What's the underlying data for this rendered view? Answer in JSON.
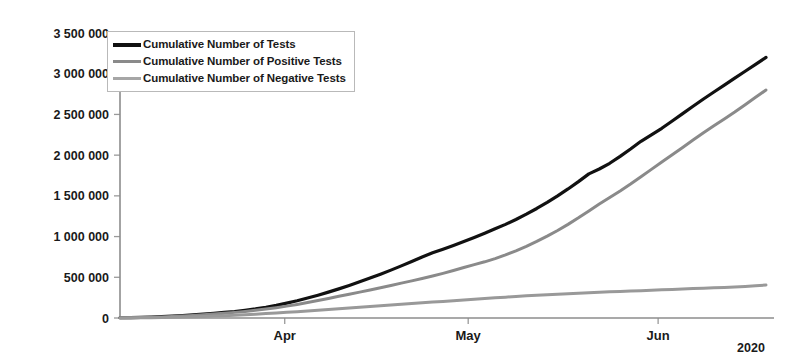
{
  "chart_data": {
    "type": "line",
    "title": "",
    "xlabel": "",
    "ylabel": "",
    "year_label": "2020",
    "grid": false,
    "legend_position": "top-left",
    "ylim": [
      0,
      3500000
    ],
    "ytick_labels": [
      "3 500 000",
      "3 000 000",
      "2 500 000",
      "2 000 000",
      "1 500 000",
      "1 000 000",
      "500 000",
      "0"
    ],
    "ytick_values": [
      3500000,
      3000000,
      2500000,
      2000000,
      1500000,
      1000000,
      500000,
      0
    ],
    "xtick_labels": [
      "Apr",
      "May",
      "Jun"
    ],
    "x_axis_note": "daily cumulative values, Mar 2020 through late Jun 2020",
    "colors": {
      "tests": "#111111",
      "positive": "#8a8a8a",
      "negative": "#999999",
      "axis": "#8c8c8c",
      "text": "#1a1a1a"
    },
    "series": [
      {
        "name": "Cumulative Number of Tests",
        "color": "#111111",
        "width": 3.2,
        "values": [
          3000,
          5000,
          8000,
          12000,
          17000,
          23000,
          30000,
          38000,
          47000,
          57000,
          68000,
          80000,
          95000,
          112000,
          132000,
          155000,
          182000,
          212000,
          245000,
          280000,
          318000,
          358000,
          400000,
          444000,
          490000,
          538000,
          588000,
          640000,
          694000,
          750000,
          800000,
          845000,
          890000,
          938000,
          988000,
          1040000,
          1095000,
          1150000,
          1210000,
          1275000,
          1345000,
          1420000,
          1500000,
          1585000,
          1675000,
          1770000,
          1830000,
          1900000,
          1985000,
          2075000,
          2170000,
          2250000,
          2330000,
          2420000,
          2510000,
          2600000,
          2690000,
          2775000,
          2860000,
          2945000,
          3030000,
          3115000,
          3200000
        ]
      },
      {
        "name": "Cumulative Number of Positive Tests",
        "color": "#8a8a8a",
        "width": 3.0,
        "values": [
          2000,
          3500,
          6000,
          9000,
          13000,
          18000,
          24000,
          31000,
          39000,
          48000,
          58000,
          69000,
          81000,
          95000,
          110000,
          127000,
          146000,
          167000,
          190000,
          214000,
          240000,
          266000,
          292000,
          318000,
          345000,
          372000,
          400000,
          428000,
          456000,
          485000,
          515000,
          548000,
          583000,
          620000,
          655000,
          690000,
          730000,
          775000,
          825000,
          880000,
          940000,
          1005000,
          1075000,
          1150000,
          1230000,
          1315000,
          1400000,
          1480000,
          1560000,
          1645000,
          1735000,
          1825000,
          1915000,
          2005000,
          2095000,
          2185000,
          2275000,
          2360000,
          2445000,
          2530000,
          2620000,
          2710000,
          2800000
        ]
      },
      {
        "name": "Cumulative Number of Negative Tests",
        "color": "#999999",
        "width": 3.0,
        "values": [
          1000,
          1800,
          3000,
          4500,
          6500,
          9000,
          12000,
          15500,
          19500,
          24000,
          29000,
          34500,
          40500,
          47000,
          54000,
          61500,
          69500,
          78000,
          87000,
          96000,
          105000,
          114000,
          123000,
          132000,
          141000,
          150000,
          159000,
          168000,
          177000,
          186000,
          195000,
          204000,
          213000,
          222000,
          231000,
          240000,
          248000,
          256000,
          264000,
          272000,
          279000,
          286000,
          292000,
          298000,
          304000,
          310000,
          316000,
          321000,
          326000,
          331000,
          336000,
          341000,
          346000,
          351000,
          356000,
          361000,
          366000,
          371000,
          376000,
          381000,
          388000,
          396000,
          405000
        ]
      }
    ],
    "endpoints": {
      "tests": 3200000,
      "positive": 2800000,
      "negative": 405000
    }
  },
  "legend": {
    "items": [
      {
        "label": "Cumulative Number of Tests",
        "color": "#111111",
        "thickness": 4
      },
      {
        "label": "Cumulative Number of Positive Tests",
        "color": "#8a8a8a",
        "thickness": 3
      },
      {
        "label": "Cumulative Number of Negative Tests",
        "color": "#a6a6a6",
        "thickness": 3
      }
    ]
  },
  "axes": {
    "year": "2020"
  }
}
